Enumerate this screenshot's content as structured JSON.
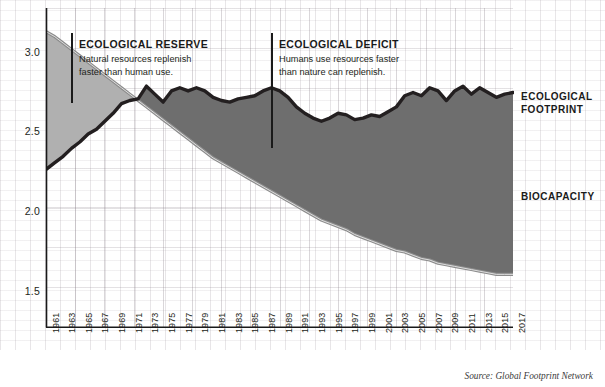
{
  "chart_data": {
    "type": "area",
    "title": "",
    "subtitle": "",
    "xlabel": "",
    "ylabel": "",
    "xlim": [
      1961,
      2017
    ],
    "ylim": [
      1.28,
      3.28
    ],
    "yticks": [
      "1.5",
      "2.0",
      "2.5",
      "3.0"
    ],
    "ytick_values": [
      1.5,
      2.0,
      2.5,
      3.0
    ],
    "grid": true,
    "legend_position": "right",
    "x": [
      1961,
      1962,
      1963,
      1964,
      1965,
      1966,
      1967,
      1968,
      1969,
      1970,
      1971,
      1972,
      1973,
      1974,
      1975,
      1976,
      1977,
      1978,
      1979,
      1980,
      1981,
      1982,
      1983,
      1984,
      1985,
      1986,
      1987,
      1988,
      1989,
      1990,
      1991,
      1992,
      1993,
      1994,
      1995,
      1996,
      1997,
      1998,
      1999,
      2000,
      2001,
      2002,
      2003,
      2004,
      2005,
      2006,
      2007,
      2008,
      2009,
      2010,
      2011,
      2012,
      2013,
      2014,
      2015,
      2016,
      2017
    ],
    "xticks": [
      "1961",
      "1963",
      "1965",
      "1967",
      "1969",
      "1971",
      "1973",
      "1975",
      "1977",
      "1979",
      "1981",
      "1983",
      "1985",
      "1987",
      "1989",
      "1991",
      "1993",
      "1995",
      "1997",
      "1999",
      "2001",
      "2003",
      "2005",
      "2007",
      "2009",
      "2011",
      "2013",
      "2015",
      "2017"
    ],
    "series": [
      {
        "name": "ECOLOGICAL FOOTPRINT",
        "color": "#231f20",
        "values": [
          2.27,
          2.31,
          2.35,
          2.4,
          2.44,
          2.49,
          2.52,
          2.57,
          2.62,
          2.68,
          2.7,
          2.71,
          2.79,
          2.74,
          2.69,
          2.76,
          2.78,
          2.76,
          2.78,
          2.76,
          2.72,
          2.7,
          2.69,
          2.71,
          2.72,
          2.73,
          2.76,
          2.78,
          2.76,
          2.72,
          2.66,
          2.62,
          2.59,
          2.57,
          2.59,
          2.62,
          2.61,
          2.58,
          2.59,
          2.61,
          2.6,
          2.63,
          2.66,
          2.73,
          2.75,
          2.73,
          2.78,
          2.76,
          2.7,
          2.76,
          2.79,
          2.74,
          2.78,
          2.75,
          2.72,
          2.74,
          2.75
        ]
      },
      {
        "name": "BIOCAPACITY",
        "color": "#8c8c8c",
        "values": [
          3.13,
          3.1,
          3.06,
          3.02,
          2.98,
          2.94,
          2.9,
          2.86,
          2.82,
          2.78,
          2.74,
          2.7,
          2.66,
          2.62,
          2.58,
          2.54,
          2.5,
          2.46,
          2.42,
          2.38,
          2.34,
          2.31,
          2.28,
          2.25,
          2.22,
          2.19,
          2.16,
          2.13,
          2.1,
          2.07,
          2.04,
          2.01,
          1.98,
          1.95,
          1.93,
          1.91,
          1.89,
          1.86,
          1.84,
          1.82,
          1.8,
          1.78,
          1.76,
          1.75,
          1.73,
          1.71,
          1.7,
          1.68,
          1.67,
          1.66,
          1.65,
          1.64,
          1.63,
          1.62,
          1.61,
          1.61,
          1.61
        ]
      }
    ],
    "regions": [
      {
        "name": "reserve",
        "title": "ECOLOGICAL RESERVE",
        "body": "Natural resources replenish faster than human use.",
        "fill": "#b0b0b0"
      },
      {
        "name": "deficit",
        "title": "ECOLOGICAL DEFICIT",
        "body": "Humans use resources faster than nature can replenish.",
        "fill": "#6e6e6e"
      }
    ],
    "source": "Source: Global Footprint Network",
    "units": "global hectares per person"
  },
  "labels": {
    "footprint_line1": "ECOLOGICAL",
    "footprint_line2": "FOOTPRINT",
    "biocapacity": "BIOCAPACITY"
  },
  "annotations": {
    "reserve": {
      "title": "ECOLOGICAL RESERVE",
      "line1": "Natural resources replenish",
      "line2": "faster than human use."
    },
    "deficit": {
      "title": "ECOLOGICAL DEFICIT",
      "line1": "Humans use resources faster",
      "line2": "than nature can replenish."
    }
  },
  "source": "Source: Global Footprint Network",
  "colors": {
    "footprint": "#231f20",
    "biocapacity": "#8c8c8c",
    "reserve_fill": "#b0b0b0",
    "deficit_fill": "#6e6e6e",
    "axis": "#1a1a1a"
  }
}
